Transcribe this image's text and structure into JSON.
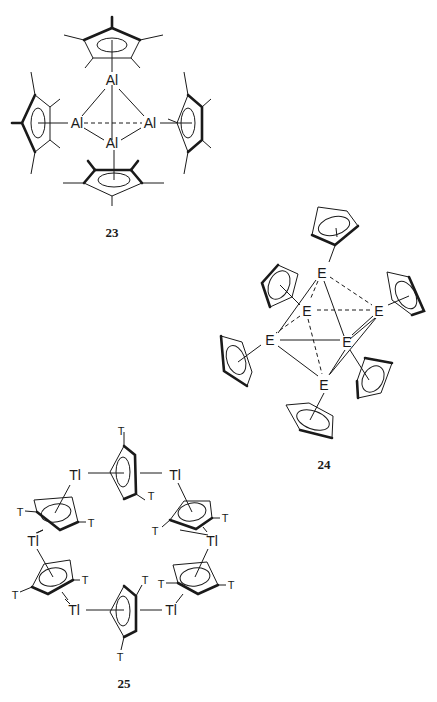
{
  "figure": {
    "structures": [
      {
        "id": "23",
        "label": "23",
        "core_atom": "Al",
        "atoms": [
          "Al",
          "Al",
          "Al",
          "Al"
        ],
        "ligand": "Cp* (pentamethylcyclopentadienyl)",
        "ligand_count": 4,
        "geometry": "tetrahedral Al4 cluster"
      },
      {
        "id": "24",
        "label": "24",
        "core_atom": "E",
        "atoms": [
          "E",
          "E",
          "E",
          "E",
          "E",
          "E"
        ],
        "ligand": "Cp (cyclopentadienyl)",
        "ligand_count": 6,
        "geometry": "octahedral E6 cluster"
      },
      {
        "id": "25",
        "label": "25",
        "core_atom": "Tl",
        "atoms": [
          "Tl",
          "Tl",
          "Tl",
          "Tl",
          "Tl",
          "Tl"
        ],
        "substituent": "T",
        "ligand_count": 6,
        "geometry": "hexameric Tl-Cp ring"
      }
    ],
    "labels": {
      "al": "Al",
      "e": "E",
      "tl": "Tl",
      "t": "T",
      "s23": "23",
      "s24": "24",
      "s25": "25"
    }
  }
}
